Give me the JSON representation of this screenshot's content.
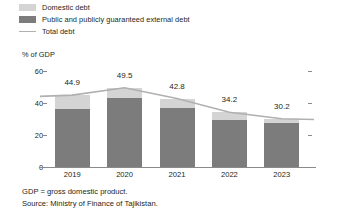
{
  "legend": {
    "items": [
      {
        "label": "Domestic debt",
        "type": "swatch",
        "color": "#d4d4d4",
        "name": "domestic-debt"
      },
      {
        "label": "Public and publicly guaranteed external debt",
        "type": "swatch",
        "color": "#7c7c7c",
        "name": "external-debt"
      },
      {
        "label": "Total debt",
        "type": "line",
        "color": "#b0b0b0",
        "name": "total-debt"
      }
    ]
  },
  "axis": {
    "y_title": "% of GDP",
    "yticks": [
      "60",
      "40",
      "20",
      "0"
    ]
  },
  "notes": {
    "line1": "GDP = gross domestic product.",
    "line2": "Source: Ministry of Finance of Tajikistan."
  },
  "chart_data": {
    "type": "bar",
    "subtype": "stacked-bar-with-line",
    "title": "",
    "xlabel": "",
    "ylabel": "% of GDP",
    "ylim": [
      0,
      60
    ],
    "yticks": [
      0,
      20,
      40,
      60
    ],
    "grid": false,
    "legend_position": "top-left",
    "categories": [
      "2019",
      "2020",
      "2021",
      "2022",
      "2023"
    ],
    "series": [
      {
        "name": "Public and publicly guaranteed external debt",
        "color": "#7c7c7c",
        "values": [
          36.5,
          43.1,
          36.8,
          29.4,
          27.3
        ]
      },
      {
        "name": "Domestic debt",
        "color": "#d4d4d4",
        "values": [
          8.4,
          6.4,
          6.0,
          4.8,
          2.9
        ]
      },
      {
        "name": "Total debt",
        "type": "line",
        "color": "#b0b0b0",
        "values": [
          44.9,
          49.5,
          42.8,
          34.2,
          30.2
        ]
      }
    ],
    "data_labels": [
      "44.9",
      "49.5",
      "42.8",
      "34.2",
      "30.2"
    ]
  }
}
